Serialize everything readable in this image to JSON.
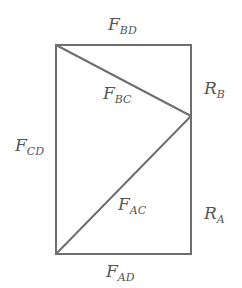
{
  "diagram": {
    "stroke_color": "#6e6e6e",
    "nodes": {
      "top_left": {
        "x": 56,
        "y": 45
      },
      "top_right": {
        "x": 191,
        "y": 45
      },
      "right_mid_C": {
        "x": 191,
        "y": 116
      },
      "bottom_left": {
        "x": 56,
        "y": 254
      },
      "bottom_right": {
        "x": 191,
        "y": 254
      }
    },
    "labels": {
      "F_BD": {
        "main": "F",
        "sub": "BD"
      },
      "F_BC": {
        "main": "F",
        "sub": "BC"
      },
      "F_CD": {
        "main": "F",
        "sub": "CD"
      },
      "F_AC": {
        "main": "F",
        "sub": "AC"
      },
      "F_AD": {
        "main": "F",
        "sub": "AD"
      },
      "R_B": {
        "main": "R",
        "sub": "B"
      },
      "R_A": {
        "main": "R",
        "sub": "A"
      }
    }
  }
}
